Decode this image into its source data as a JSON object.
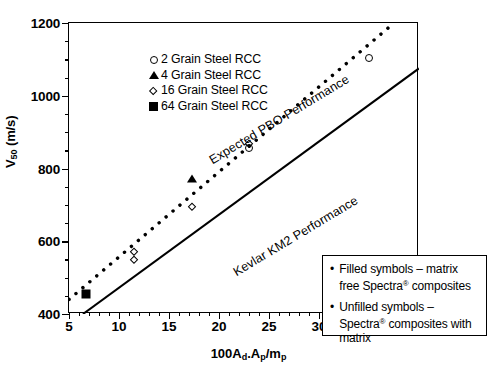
{
  "chart_data": {
    "type": "scatter",
    "title": "",
    "xlabel": "100Ad.Ap/mp",
    "ylabel": "V50 (m/s)",
    "xlim": [
      5,
      40
    ],
    "ylim": [
      400,
      1200
    ],
    "grid": false,
    "legend_position": "top-left",
    "x_ticks": [
      {
        "value": 5,
        "label": "5"
      },
      {
        "value": 10,
        "label": "10"
      },
      {
        "value": 15,
        "label": "15"
      },
      {
        "value": 20,
        "label": "20"
      },
      {
        "value": 25,
        "label": "25"
      },
      {
        "value": 30,
        "label": "30"
      },
      {
        "value": 35,
        "label": "35"
      },
      {
        "value": 40,
        "label": "40"
      }
    ],
    "x_minor_step": 1,
    "y_ticks": [
      {
        "value": 400,
        "label": "400"
      },
      {
        "value": 600,
        "label": "600"
      },
      {
        "value": 800,
        "label": "800"
      },
      {
        "value": 1000,
        "label": "1000"
      },
      {
        "value": 1200,
        "label": "1200"
      }
    ],
    "y_minor_step": 50,
    "series": [
      {
        "name": "2 Grain Steel RCC",
        "marker": "circle-open",
        "points": [
          {
            "x": 23.0,
            "y": 855
          },
          {
            "x": 35.0,
            "y": 1105
          }
        ]
      },
      {
        "name": "4 Grain Steel RCC",
        "marker": "triangle-filled",
        "points": [
          {
            "x": 17.3,
            "y": 775
          }
        ]
      },
      {
        "name": "16 Grain Steel RCC",
        "marker": "diamond-open",
        "points": [
          {
            "x": 11.5,
            "y": 570
          },
          {
            "x": 11.5,
            "y": 548
          },
          {
            "x": 17.3,
            "y": 695
          },
          {
            "x": 23.0,
            "y": 868
          }
        ]
      },
      {
        "name": "64 Grain Steel RCC",
        "marker": "square-filled",
        "points": [
          {
            "x": 6.7,
            "y": 455
          }
        ]
      }
    ],
    "trend_lines": [
      {
        "name": "Expected PBO Performance",
        "style": "dotted",
        "label": "Expected PBO Performance",
        "x1": 5.0,
        "y1": 440,
        "x2": 37.5,
        "y2": 1200
      },
      {
        "name": "Kevlar KM2 Performance",
        "style": "solid",
        "label": "Kevlar KM2 Performance",
        "x1": 6.4,
        "y1": 400,
        "x2": 40.0,
        "y2": 1075
      }
    ]
  },
  "legend": {
    "items": [
      {
        "label": "2 Grain Steel RCC",
        "marker": "circle-open"
      },
      {
        "label": "4 Grain Steel RCC",
        "marker": "triangle-filled"
      },
      {
        "label": "16 Grain Steel RCC",
        "marker": "diamond-open"
      },
      {
        "label": "64 Grain Steel RCC",
        "marker": "square-filled"
      }
    ]
  },
  "notes": {
    "items": [
      {
        "bullet": "•",
        "text_before": "Filled symbols – matrix free Spectra",
        "sup": "®",
        "text_after": " composites"
      },
      {
        "bullet": "•",
        "text_before": "Unfilled symbols – Spectra",
        "sup": "®",
        "text_after": " composites with matrix"
      }
    ]
  },
  "axis_titles": {
    "x_prefix": "100A",
    "x_sub1": "d",
    "x_mid": ".A",
    "x_sub2": "p",
    "x_slash": "/m",
    "x_sub3": "p",
    "y_prefix": "V",
    "y_sub": "50",
    "y_suffix": " (m/s)"
  }
}
